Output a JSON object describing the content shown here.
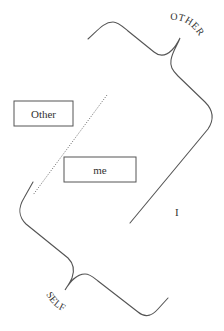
{
  "diagram": {
    "labels": {
      "other_box": "Other",
      "me_box": "me",
      "i_label": "I",
      "other_curve": "OTHER",
      "self_curve": "SELF"
    },
    "colors": {
      "stroke": "#555555",
      "text": "#333333",
      "background": "#ffffff"
    }
  }
}
